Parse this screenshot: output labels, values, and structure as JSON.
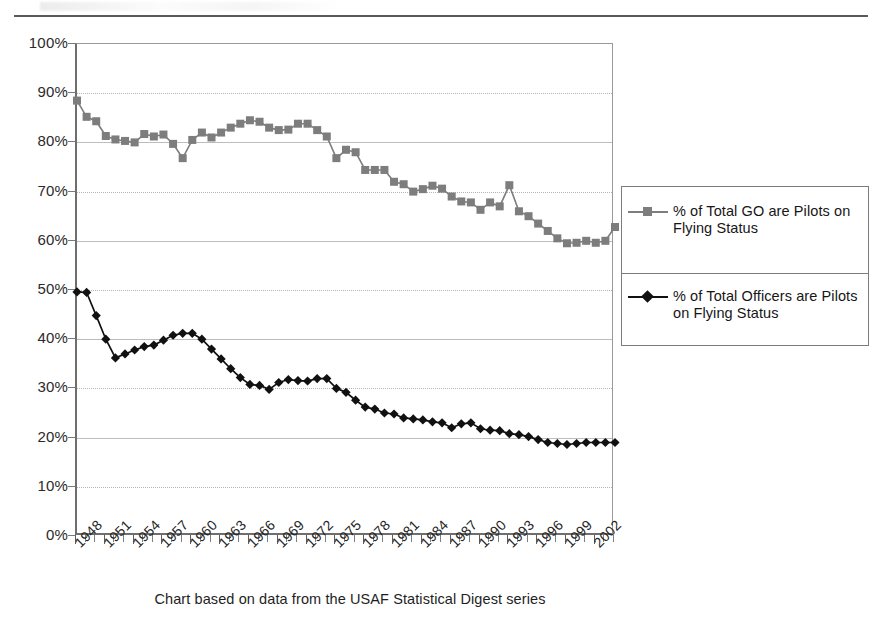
{
  "caption": "Chart based on data from the USAF Statistical Digest series",
  "axes": {
    "y_ticks": [
      "0%",
      "10%",
      "20%",
      "30%",
      "40%",
      "50%",
      "60%",
      "70%",
      "80%",
      "90%",
      "100%"
    ],
    "x_ticks": [
      "1948",
      "1951",
      "1954",
      "1957",
      "1960",
      "1963",
      "1966",
      "1969",
      "1972",
      "1975",
      "1978",
      "1981",
      "1984",
      "1987",
      "1990",
      "1993",
      "1996",
      "1999",
      "2002"
    ]
  },
  "legend": {
    "entries": [
      {
        "label": "% of Total GO are Pilots on Flying Status",
        "marker": "square-marker",
        "color": "#7d7d7d"
      },
      {
        "label": "% of Total Officers are Pilots on Flying Status",
        "marker": "diamond-marker",
        "color": "#111111"
      }
    ]
  },
  "chart_data": {
    "type": "line",
    "title": "",
    "subtitle": "",
    "xlabel": "",
    "ylabel": "",
    "xlim": [
      1948,
      2004
    ],
    "ylim": [
      0,
      100
    ],
    "grid": true,
    "legend_position": "right",
    "annotations": [
      "Chart based on data from the USAF Statistical Digest series"
    ],
    "x": [
      1948,
      1949,
      1950,
      1951,
      1952,
      1953,
      1954,
      1955,
      1956,
      1957,
      1958,
      1959,
      1960,
      1961,
      1962,
      1963,
      1964,
      1965,
      1966,
      1967,
      1968,
      1969,
      1970,
      1971,
      1972,
      1973,
      1974,
      1975,
      1976,
      1977,
      1978,
      1979,
      1980,
      1981,
      1982,
      1983,
      1984,
      1985,
      1986,
      1987,
      1988,
      1989,
      1990,
      1991,
      1992,
      1993,
      1994,
      1995,
      1996,
      1997,
      1998,
      1999,
      2000,
      2001,
      2002,
      2003,
      2004
    ],
    "series": [
      {
        "name": "% of Total GO are Pilots on Flying Status",
        "marker": "square",
        "color": "#7d7d7d",
        "values": [
          88.5,
          85.2,
          84.3,
          81.3,
          80.6,
          80.3,
          80.0,
          81.7,
          81.2,
          81.6,
          79.7,
          76.8,
          80.5,
          82.0,
          81.0,
          82.0,
          83.0,
          83.8,
          84.5,
          84.2,
          83.0,
          82.5,
          82.6,
          83.8,
          83.8,
          82.5,
          81.2,
          76.8,
          78.5,
          78.0,
          74.4,
          74.4,
          74.4,
          72.0,
          71.5,
          70.0,
          70.5,
          71.2,
          70.6,
          69.0,
          68.0,
          67.8,
          66.3,
          67.8,
          67.0,
          71.3,
          66.0,
          65.0,
          63.5,
          62.0,
          60.5,
          59.5,
          59.6,
          60.0,
          59.6,
          60.0,
          62.8
        ]
      },
      {
        "name": "% of Total Officers are Pilots on Flying Status",
        "marker": "diamond",
        "color": "#111111",
        "values": [
          49.6,
          49.5,
          44.8,
          40.0,
          36.2,
          37.0,
          37.8,
          38.5,
          38.8,
          39.8,
          40.8,
          41.2,
          41.2,
          40.0,
          38.0,
          36.0,
          34.0,
          32.2,
          30.8,
          30.6,
          29.8,
          31.2,
          31.8,
          31.6,
          31.5,
          32.0,
          32.0,
          30.0,
          29.2,
          27.6,
          26.2,
          25.8,
          25.0,
          24.8,
          24.0,
          23.8,
          23.6,
          23.2,
          23.0,
          22.0,
          22.8,
          23.0,
          21.8,
          21.5,
          21.4,
          20.8,
          20.6,
          20.2,
          19.6,
          19.0,
          18.8,
          18.6,
          18.8,
          19.0,
          19.0,
          19.0,
          19.0
        ]
      }
    ]
  }
}
